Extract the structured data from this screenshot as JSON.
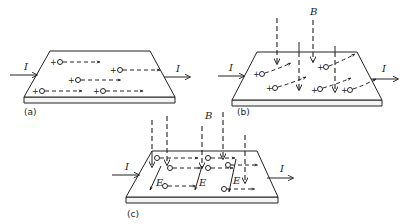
{
  "figure": {
    "panels": [
      {
        "id": "a",
        "caption": "(a)",
        "current_label_in": "I",
        "current_label_out": "I",
        "charge_sign": "+",
        "field_label": ""
      },
      {
        "id": "b",
        "caption": "(b)",
        "current_label_in": "I",
        "current_label_out": "I",
        "charge_sign": "+",
        "field_label": "B"
      },
      {
        "id": "c",
        "caption": "(c)",
        "current_label_in": "I",
        "current_label_out": "I",
        "field_label": "B",
        "electric_field_label": "E"
      }
    ]
  }
}
